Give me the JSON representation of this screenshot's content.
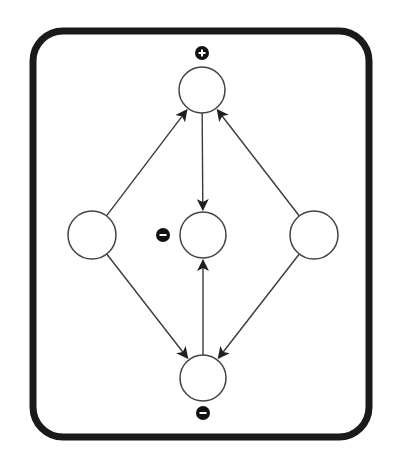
{
  "diagram": {
    "frame": {
      "x": 33,
      "y": 31,
      "width": 336,
      "height": 406,
      "radius": 30,
      "stroke": "#1a1a1a",
      "stroke_width": 7
    },
    "colors": {
      "line": "#3a3a3a",
      "node_stroke": "#444444",
      "node_fill": "#ffffff",
      "badge_fill": "#111111",
      "badge_glyph": "#ffffff"
    },
    "nodes": [
      {
        "id": "top",
        "cx": 202,
        "cy": 90,
        "r": 23
      },
      {
        "id": "left",
        "cx": 92,
        "cy": 235,
        "r": 24
      },
      {
        "id": "center",
        "cx": 203,
        "cy": 235,
        "r": 23
      },
      {
        "id": "right",
        "cx": 314,
        "cy": 235,
        "r": 24
      },
      {
        "id": "bottom",
        "cx": 203,
        "cy": 378,
        "r": 23
      }
    ],
    "edges": [
      {
        "from": "left",
        "to": "top"
      },
      {
        "from": "right",
        "to": "top"
      },
      {
        "from": "top",
        "to": "center"
      },
      {
        "from": "left",
        "to": "bottom"
      },
      {
        "from": "right",
        "to": "bottom"
      },
      {
        "from": "bottom",
        "to": "center"
      }
    ],
    "badges": [
      {
        "node": "top",
        "sign": "+",
        "cx": 202,
        "cy": 53,
        "r": 7
      },
      {
        "node": "center",
        "sign": "-",
        "cx": 163,
        "cy": 235,
        "r": 7
      },
      {
        "node": "bottom",
        "sign": "-",
        "cx": 203,
        "cy": 413,
        "r": 7
      }
    ]
  }
}
